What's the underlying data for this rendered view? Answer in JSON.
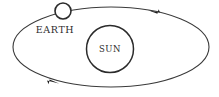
{
  "diagram": {
    "background_color": "#ffffff",
    "line_color": "#3a3a3a",
    "body_stroke_color": "#2b2b2b",
    "body_fill_color": "#ffffff",
    "arrow_color": "#1e1e1e",
    "label_color": "#2b2b2b",
    "orbit": {
      "name": "orbit-ellipse",
      "shape": "ellipse",
      "center_x": 111,
      "center_y": 47,
      "radius_x": 98,
      "radius_y": 40,
      "direction": "counterclockwise"
    },
    "sun": {
      "label": "SUN",
      "center_x": 110,
      "center_y": 49,
      "radius": 23.5
    },
    "earth": {
      "label": "EARTH",
      "circle_center_x": 63,
      "circle_center_y": 11,
      "circle_radius": 8,
      "label_x": 55,
      "label_y": 33
    },
    "arrows": [
      {
        "name": "orbit-arrow-top",
        "position_x": 155,
        "position_y": 11,
        "direction": "left"
      },
      {
        "name": "orbit-arrow-bottom",
        "position_x": 52,
        "position_y": 82,
        "direction": "right"
      }
    ]
  }
}
